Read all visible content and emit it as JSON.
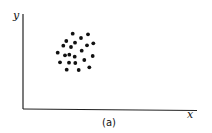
{
  "figure": {
    "y_axis_label": "y",
    "x_axis_label": "x",
    "caption": "(a)"
  },
  "chart_data": {
    "type": "scatter",
    "title": "",
    "xlabel": "x",
    "ylabel": "y",
    "caption": "(a)",
    "grid": false,
    "note": "Pixel positions of points relative to image; single clustered cloud of 22 points in upper-left region of axes",
    "points": [
      [
        72.7,
        33.7
      ],
      [
        88,
        34.3
      ],
      [
        81,
        38
      ],
      [
        66.3,
        41
      ],
      [
        75,
        42.7
      ],
      [
        93.3,
        43.3
      ],
      [
        63.3,
        45.7
      ],
      [
        71,
        47
      ],
      [
        87,
        45.3
      ],
      [
        57.7,
        52.7
      ],
      [
        81.7,
        50.7
      ],
      [
        65,
        55.3
      ],
      [
        69.3,
        54.7
      ],
      [
        74.7,
        56.7
      ],
      [
        92.7,
        56
      ],
      [
        60,
        62.3
      ],
      [
        69,
        62.7
      ],
      [
        75.3,
        63
      ],
      [
        84.3,
        60
      ],
      [
        66.7,
        69.7
      ],
      [
        78.7,
        70
      ],
      [
        89.3,
        67.3
      ]
    ]
  }
}
